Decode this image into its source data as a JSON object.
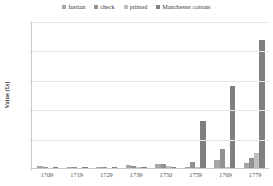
{
  "chart_data": {
    "type": "bar",
    "title": "",
    "xlabel": "",
    "ylabel": "Value (£s)",
    "categories": [
      "1709",
      "1719",
      "1729",
      "1739",
      "1750",
      "1759",
      "1769",
      "1779"
    ],
    "series": [
      {
        "name": "fustian",
        "color": "#a6a6a6",
        "values": [
          3500,
          1500,
          1200,
          4500,
          6500,
          2000,
          14000,
          9000
        ]
      },
      {
        "name": "check",
        "color": "#919191",
        "values": [
          1000,
          1500,
          2000,
          4000,
          6000,
          11000,
          33000,
          17000
        ]
      },
      {
        "name": "printed",
        "color": "#bfbfbf",
        "values": [
          0,
          0,
          0,
          2500,
          3000,
          1500,
          2500,
          25000
        ]
      },
      {
        "name": "Manchester cottons",
        "color": "#808080",
        "values": [
          1500,
          1500,
          1500,
          2000,
          2500,
          80000,
          140000,
          218000
        ]
      }
    ],
    "ylim": [
      0,
      250000
    ],
    "yticks": [
      "0",
      "50000",
      "100000",
      "150000",
      "200000",
      "250000"
    ],
    "ytick_values": [
      0,
      50000,
      100000,
      150000,
      200000,
      250000
    ],
    "grid": true,
    "legend_position": "top"
  }
}
